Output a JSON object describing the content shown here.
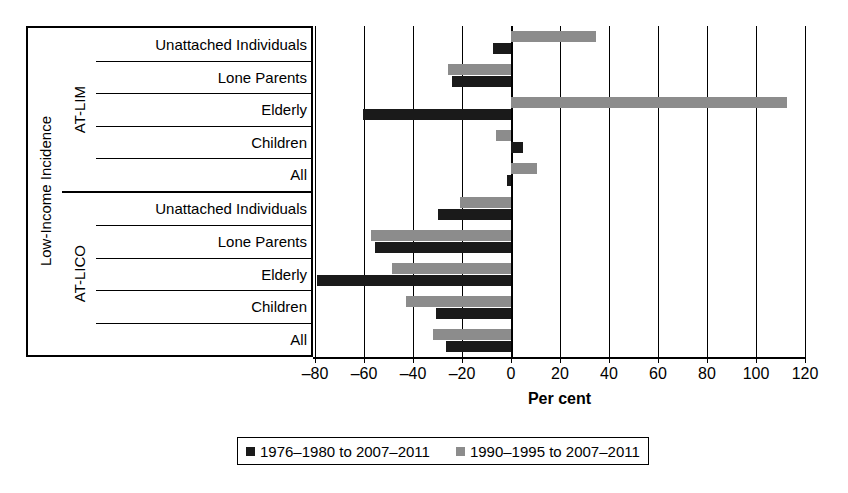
{
  "axis_title": "Low-Income Incidence",
  "xlabel": "Per cent",
  "groups": [
    {
      "name": "AT-LIM",
      "categories": [
        "Unattached Individuals",
        "Lone Parents",
        "Elderly",
        "Children",
        "All"
      ]
    },
    {
      "name": "AT-LICO",
      "categories": [
        "Unattached Individuals",
        "Lone Parents",
        "Elderly",
        "Children",
        "All"
      ]
    }
  ],
  "legend": {
    "items": [
      {
        "label": "1976–1980 to 2007–2011",
        "swatch": "black",
        "color": "#1a1a1a"
      },
      {
        "label": "1990–1995 to 2007–2011",
        "swatch": "gray",
        "color": "#8c8c8c"
      }
    ]
  },
  "xticks": [
    "–80",
    "–60",
    "–40",
    "–20",
    "0",
    "20",
    "40",
    "60",
    "80",
    "100",
    "120"
  ],
  "chart_data": {
    "type": "bar",
    "orientation": "horizontal",
    "title": "",
    "xlabel": "Per cent",
    "ylabel": "Low-Income Incidence",
    "xlim": [
      -90,
      120
    ],
    "xticks": [
      -80,
      -60,
      -40,
      -20,
      0,
      20,
      40,
      60,
      80,
      100,
      120
    ],
    "grid": true,
    "legend_position": "bottom",
    "categories": [
      "AT-LIM / Unattached Individuals",
      "AT-LIM / Lone Parents",
      "AT-LIM / Elderly",
      "AT-LIM / Children",
      "AT-LIM / All",
      "AT-LICO / Unattached Individuals",
      "AT-LICO / Lone Parents",
      "AT-LICO / Elderly",
      "AT-LICO / Children",
      "AT-LICO / All"
    ],
    "series": [
      {
        "name": "1976–1980 to 2007–2011",
        "color": "#1a1a1a",
        "values": [
          -7.3,
          -24.2,
          -60.5,
          4.8,
          -1.5,
          -29.7,
          -55.5,
          -79.0,
          -30.6,
          -26.5
        ]
      },
      {
        "name": "1990–1995 to 2007–2011",
        "color": "#8c8c8c",
        "values": [
          34.7,
          -25.8,
          112.5,
          -6.0,
          10.5,
          -20.8,
          -57.0,
          -48.7,
          -42.9,
          -31.7
        ]
      }
    ]
  }
}
